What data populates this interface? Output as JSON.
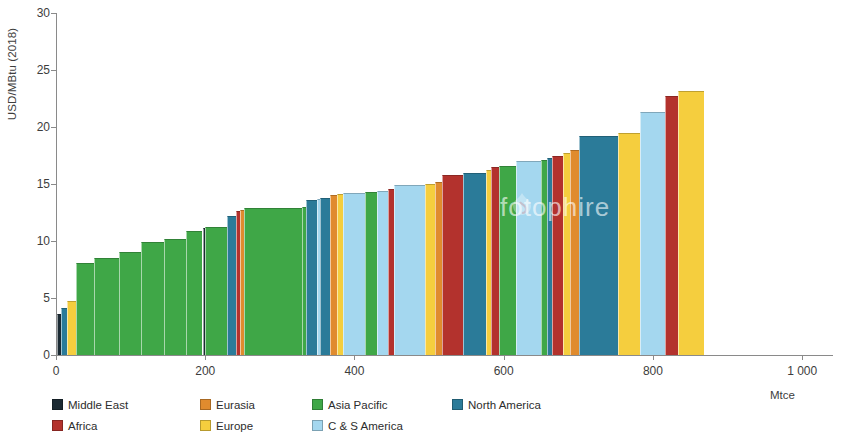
{
  "chart_data": {
    "type": "bar",
    "title": "",
    "subtitle": "",
    "xlabel": "Mtce",
    "ylabel": "USD/MBtu (2018)",
    "xlim": [
      0,
      1040
    ],
    "ylim": [
      0,
      30
    ],
    "x_ticks": [
      0,
      200,
      400,
      600,
      800,
      1000
    ],
    "x_tick_labels": [
      "0",
      "200",
      "400",
      "600",
      "800",
      "1 000"
    ],
    "y_ticks": [
      0,
      5,
      10,
      15,
      20,
      25,
      30
    ],
    "y_tick_labels": [
      "0",
      "5",
      "10",
      "15",
      "20",
      "25",
      "30"
    ],
    "grid": false,
    "legend_position": "bottom-left",
    "orientation": "vertical",
    "watermark": "fotophire",
    "series_colors": {
      "Middle East": "#1b2a33",
      "Eurasia": "#e08b2e",
      "Asia Pacific": "#3fa747",
      "North America": "#2b7b99",
      "Africa": "#b3322d",
      "Europe": "#f5ce3e",
      "C & S America": "#a4d7ef"
    },
    "bars": [
      {
        "region": "Middle East",
        "x0": 0,
        "width": 6,
        "value": 3.6
      },
      {
        "region": "North America",
        "x0": 6,
        "width": 8,
        "value": 4.1
      },
      {
        "region": "Europe",
        "x0": 14,
        "width": 11,
        "value": 4.7
      },
      {
        "region": "Asia Pacific",
        "x0": 25,
        "width": 24,
        "value": 8.1
      },
      {
        "region": "Asia Pacific",
        "x0": 49,
        "width": 34,
        "value": 8.5
      },
      {
        "region": "Asia Pacific",
        "x0": 83,
        "width": 30,
        "value": 9.0
      },
      {
        "region": "Asia Pacific",
        "x0": 113,
        "width": 30,
        "value": 9.9
      },
      {
        "region": "Asia Pacific",
        "x0": 143,
        "width": 30,
        "value": 10.2
      },
      {
        "region": "Asia Pacific",
        "x0": 173,
        "width": 22,
        "value": 10.9
      },
      {
        "region": "Middle East",
        "x0": 195,
        "width": 4,
        "value": 11.1
      },
      {
        "region": "Asia Pacific",
        "x0": 199,
        "width": 29,
        "value": 11.2
      },
      {
        "region": "North America",
        "x0": 228,
        "width": 12,
        "value": 12.2
      },
      {
        "region": "Africa",
        "x0": 240,
        "width": 5,
        "value": 12.6
      },
      {
        "region": "Eurasia",
        "x0": 245,
        "width": 5,
        "value": 12.7
      },
      {
        "region": "Asia Pacific",
        "x0": 250,
        "width": 78,
        "value": 12.9
      },
      {
        "region": "Asia Pacific",
        "x0": 328,
        "width": 6,
        "value": 13.0
      },
      {
        "region": "North America",
        "x0": 334,
        "width": 14,
        "value": 13.6
      },
      {
        "region": "C & S America",
        "x0": 348,
        "width": 5,
        "value": 13.7
      },
      {
        "region": "North America",
        "x0": 353,
        "width": 13,
        "value": 13.8
      },
      {
        "region": "Eurasia",
        "x0": 366,
        "width": 9,
        "value": 14.0
      },
      {
        "region": "Europe",
        "x0": 375,
        "width": 8,
        "value": 14.1
      },
      {
        "region": "C & S America",
        "x0": 383,
        "width": 30,
        "value": 14.2
      },
      {
        "region": "Asia Pacific",
        "x0": 413,
        "width": 16,
        "value": 14.3
      },
      {
        "region": "C & S America",
        "x0": 429,
        "width": 14,
        "value": 14.4
      },
      {
        "region": "Africa",
        "x0": 443,
        "width": 8,
        "value": 14.6
      },
      {
        "region": "C & S America",
        "x0": 451,
        "width": 42,
        "value": 14.9
      },
      {
        "region": "Europe",
        "x0": 493,
        "width": 14,
        "value": 15.0
      },
      {
        "region": "Eurasia",
        "x0": 507,
        "width": 9,
        "value": 15.2
      },
      {
        "region": "Africa",
        "x0": 516,
        "width": 28,
        "value": 15.8
      },
      {
        "region": "North America",
        "x0": 544,
        "width": 31,
        "value": 16.0
      },
      {
        "region": "Europe",
        "x0": 575,
        "width": 7,
        "value": 16.2
      },
      {
        "region": "Africa",
        "x0": 582,
        "width": 10,
        "value": 16.5
      },
      {
        "region": "Asia Pacific",
        "x0": 592,
        "width": 23,
        "value": 16.6
      },
      {
        "region": "C & S America",
        "x0": 615,
        "width": 34,
        "value": 17.0
      },
      {
        "region": "Asia Pacific",
        "x0": 649,
        "width": 8,
        "value": 17.1
      },
      {
        "region": "North America",
        "x0": 657,
        "width": 6,
        "value": 17.3
      },
      {
        "region": "Africa",
        "x0": 663,
        "width": 15,
        "value": 17.5
      },
      {
        "region": "Europe",
        "x0": 678,
        "width": 10,
        "value": 17.7
      },
      {
        "region": "Eurasia",
        "x0": 688,
        "width": 12,
        "value": 18.0
      },
      {
        "region": "North America",
        "x0": 700,
        "width": 52,
        "value": 19.2
      },
      {
        "region": "Europe",
        "x0": 752,
        "width": 30,
        "value": 19.5
      },
      {
        "region": "C & S America",
        "x0": 782,
        "width": 33,
        "value": 21.3
      },
      {
        "region": "Africa",
        "x0": 815,
        "width": 17,
        "value": 22.7
      },
      {
        "region": "Europe",
        "x0": 832,
        "width": 35,
        "value": 23.2
      }
    ]
  },
  "axes": {
    "y_title": "USD/MBtu (2018)",
    "x_title": "Mtce",
    "y_labels": [
      "30",
      "25",
      "20",
      "15",
      "10",
      "5",
      "0"
    ],
    "x_labels": [
      "0",
      "200",
      "400",
      "600",
      "800",
      "1 000"
    ]
  },
  "legend": {
    "items": [
      {
        "label": "Middle East",
        "color": "#1b2a33"
      },
      {
        "label": "Eurasia",
        "color": "#e08b2e"
      },
      {
        "label": "Asia Pacific",
        "color": "#3fa747"
      },
      {
        "label": "North America",
        "color": "#2b7b99"
      },
      {
        "label": "Africa",
        "color": "#b3322d"
      },
      {
        "label": "Europe",
        "color": "#f5ce3e"
      },
      {
        "label": "C & S America",
        "color": "#a4d7ef"
      }
    ]
  },
  "watermark": {
    "text": "fotophire"
  }
}
